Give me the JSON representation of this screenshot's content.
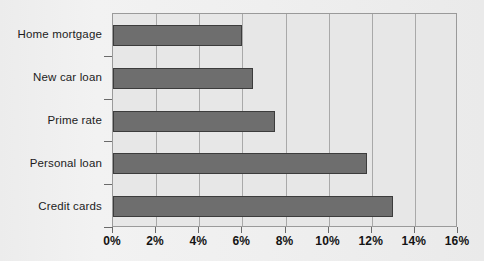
{
  "chart_data": {
    "type": "bar",
    "orientation": "horizontal",
    "title": "",
    "subtitle": "",
    "xlabel": "",
    "ylabel": "",
    "categories": [
      "Home mortgage",
      "New car loan",
      "Prime rate",
      "Personal loan",
      "Credit cards"
    ],
    "values": [
      6.0,
      6.5,
      7.5,
      11.8,
      13.0
    ],
    "value_unit": "%",
    "series": [
      {
        "name": "Interest rate",
        "values": [
          6.0,
          6.5,
          7.5,
          11.8,
          13.0
        ]
      }
    ],
    "xlim": [
      0,
      16
    ],
    "ylim": null,
    "xticks": [
      0,
      2,
      4,
      6,
      8,
      10,
      12,
      14,
      16
    ],
    "xtick_labels": [
      "0%",
      "2%",
      "4%",
      "6%",
      "8%",
      "10%",
      "12%",
      "14%",
      "16%"
    ],
    "grid": "vertical",
    "legend": null,
    "legend_position": "none",
    "annotations": [],
    "colors": {
      "bar_fill": "#6e6e6e",
      "bar_border": "#3c3c3c",
      "plot_background": "#e7e7e7",
      "page_background": "#efefef",
      "gridline": "#a9a9a9",
      "axis_line": "#9a9a9a",
      "text": "#141414"
    }
  }
}
